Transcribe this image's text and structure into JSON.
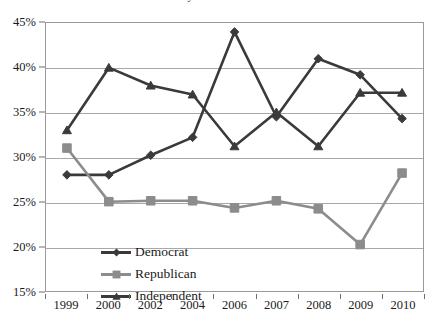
{
  "title_strip": "Party Identification",
  "chart_data": {
    "type": "line",
    "title": "",
    "xlabel": "",
    "ylabel": "",
    "categories": [
      "1999",
      "2000",
      "2002",
      "2004",
      "2006",
      "2007",
      "2008",
      "2009",
      "2010"
    ],
    "ylim": [
      15,
      45
    ],
    "ytick_values": [
      45,
      40,
      35,
      30,
      25,
      20,
      15
    ],
    "ytick_labels": [
      "45%",
      "40%",
      "35%",
      "30%",
      "25%",
      "20%",
      "15%"
    ],
    "grid": true,
    "grid_axis": "y",
    "legend_position": "inside-lower-left",
    "series": [
      {
        "name": "Democrat",
        "marker": "diamond",
        "color": "#3a3a3a",
        "values": [
          28.0,
          28.0,
          30.2,
          32.2,
          44.0,
          34.5,
          41.0,
          39.2,
          34.3
        ]
      },
      {
        "name": "Republican",
        "marker": "square",
        "color": "#8c8c8c",
        "values": [
          31.0,
          25.0,
          25.1,
          25.1,
          24.3,
          25.1,
          24.2,
          20.2,
          28.2
        ]
      },
      {
        "name": "Independent",
        "marker": "triangle",
        "color": "#3a3a3a",
        "values": [
          33.0,
          40.0,
          38.0,
          37.0,
          31.2,
          35.0,
          31.2,
          37.2,
          37.2
        ]
      }
    ]
  },
  "colors": {
    "democrat": "#3a3a3a",
    "republican": "#8c8c8c",
    "independent": "#3a3a3a",
    "gridline": "#a8a8a8",
    "frame": "#9a9a9a",
    "text": "#1a1a1a"
  }
}
